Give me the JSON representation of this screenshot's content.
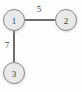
{
  "diagram": {
    "type": "undirected-weighted-graph",
    "width": 82,
    "height": 92,
    "background_color": "#fdfdfd",
    "node_fill_color": "#e9e9e9",
    "node_stroke_color": "#8a8a8a",
    "edge_color": "#2f2f2f",
    "text_color": "#3a3a3a",
    "nodes": [
      {
        "id": "1",
        "label": "1",
        "cx": 14,
        "cy": 20,
        "r": 11
      },
      {
        "id": "2",
        "label": "2",
        "cx": 66,
        "cy": 20,
        "r": 11
      },
      {
        "id": "3",
        "label": "3",
        "cx": 14,
        "cy": 73,
        "r": 11
      }
    ],
    "edges": [
      {
        "id": "1-2",
        "source": "1",
        "target": "2",
        "weight": "5",
        "x1": 25,
        "y1": 20,
        "x2": 55,
        "y2": 20,
        "label_x": 39,
        "label_y": 9
      },
      {
        "id": "1-3",
        "source": "1",
        "target": "3",
        "weight": "7",
        "x1": 14,
        "y1": 31,
        "x2": 14,
        "y2": 62,
        "label_x": 7,
        "label_y": 45
      }
    ]
  }
}
